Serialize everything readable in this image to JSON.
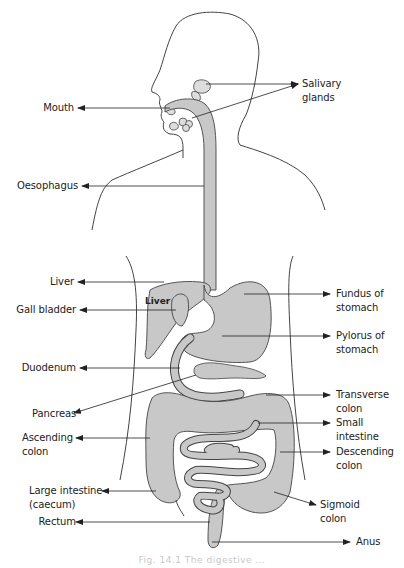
{
  "figure": {
    "caption": "Fig. 14.1 The digestive ...",
    "organ_fill": "#c8c8c8",
    "outline_color": "#444444",
    "leader_color": "#222222"
  },
  "labels": {
    "left": [
      {
        "id": "mouth",
        "lines": [
          "Mouth"
        ]
      },
      {
        "id": "oesophagus",
        "lines": [
          "Oesophagus"
        ]
      },
      {
        "id": "liver",
        "lines": [
          "Liver"
        ]
      },
      {
        "id": "gall_bladder",
        "lines": [
          "Gall bladder"
        ]
      },
      {
        "id": "duodenum",
        "lines": [
          "Duodenum"
        ]
      },
      {
        "id": "pancreas",
        "lines": [
          "Pancreas"
        ]
      },
      {
        "id": "ascending_colon",
        "lines": [
          "Ascending",
          "colon"
        ]
      },
      {
        "id": "large_intestine",
        "lines": [
          "Large intestine",
          "(caecum)"
        ]
      },
      {
        "id": "rectum",
        "lines": [
          "Rectum"
        ]
      }
    ],
    "right": [
      {
        "id": "salivary_glands",
        "lines": [
          "Salivary",
          "glands"
        ]
      },
      {
        "id": "fundus",
        "lines": [
          "Fundus of",
          "stomach"
        ]
      },
      {
        "id": "pylorus",
        "lines": [
          "Pylorus of",
          "stomach"
        ]
      },
      {
        "id": "transverse_colon",
        "lines": [
          "Transverse",
          "colon"
        ]
      },
      {
        "id": "small_intestine",
        "lines": [
          "Small",
          "intestine"
        ]
      },
      {
        "id": "descending_colon",
        "lines": [
          "Descending",
          "colon"
        ]
      },
      {
        "id": "sigmoid_colon",
        "lines": [
          "Sigmoid",
          "colon"
        ]
      },
      {
        "id": "anus",
        "lines": [
          "Anus"
        ]
      }
    ],
    "inline": {
      "liver_organ": "Liver"
    }
  }
}
